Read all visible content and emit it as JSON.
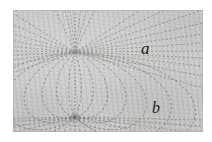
{
  "figure": {
    "kind": "magnetic-dipole-field-diagram",
    "caption_labels": {
      "upper_label": "a",
      "lower_label": "b"
    },
    "plate": {
      "background_color": "#c9c9c7",
      "page_color": "#ffffff",
      "line_color": "#6f6f6d",
      "border_color": "#b4b4b2",
      "left": 13,
      "top": 10,
      "width": 190,
      "height": 122
    },
    "poles": {
      "upper": {
        "name": "upper-pole",
        "x": 62,
        "y": 42
      },
      "lower": {
        "name": "lower-pole",
        "x": 62,
        "y": 107
      }
    },
    "axis": {
      "name": "vertical-dotted-axis",
      "x": 62,
      "y_top": 0,
      "y_bottom": 122,
      "style": "dotted"
    },
    "field_lines": {
      "radiating_count": 22,
      "loop_count": 9,
      "style": "dashed"
    }
  }
}
